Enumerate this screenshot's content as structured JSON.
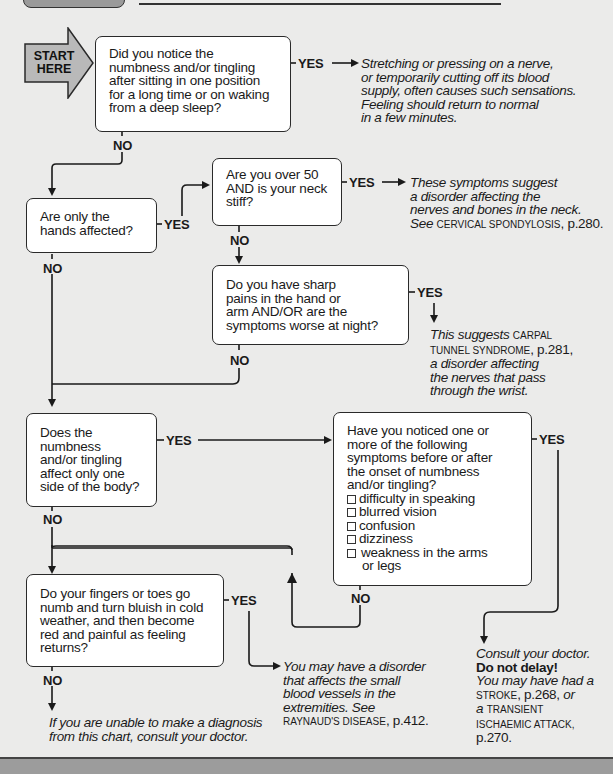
{
  "header": {
    "title_tab": "",
    "rule": true
  },
  "start": {
    "label_line1": "START",
    "label_line2": "HERE"
  },
  "colors": {
    "background": "#ebebea",
    "box_fill": "#ffffff",
    "line": "#1a1a1a",
    "start_arrow": "#b9b9b9",
    "bottom_band": "#9c9c9c"
  },
  "questions": [
    {
      "id": "q1",
      "lines": [
        "Did you notice the",
        "numbness and/or tingling",
        "after sitting in one position",
        "for a long time or on waking",
        "from a deep sleep?"
      ]
    },
    {
      "id": "q2",
      "lines": [
        "Are only the",
        "hands affected?"
      ]
    },
    {
      "id": "q3",
      "lines": [
        "Are you over 50",
        "AND is your neck",
        "stiff?"
      ]
    },
    {
      "id": "q4",
      "lines": [
        "Do you have sharp",
        "pains in the hand or",
        "arm AND/OR are the",
        "symptoms worse at night?"
      ]
    },
    {
      "id": "q5",
      "lines": [
        "Does the",
        "numbness",
        "and/or tingling",
        "affect only one",
        "side of the body?"
      ]
    },
    {
      "id": "q6",
      "lines": [
        "Have you noticed one or",
        "more of the following",
        "symptoms before or after",
        "the onset of numbness",
        "and/or tingling?"
      ],
      "checklist": [
        "difficulty in speaking",
        "blurred vision",
        "confusion",
        "dizziness",
        "weakness in the arms",
        "or legs"
      ]
    },
    {
      "id": "q7",
      "lines": [
        "Do your fingers or toes go",
        "numb and turn bluish in cold",
        "weather, and then become",
        "red and painful as feeling",
        "returns?"
      ]
    }
  ],
  "labels": {
    "yes": "YES",
    "no": "NO"
  },
  "outcomes": {
    "o1": {
      "lines": [
        "Stretching or pressing on a nerve,",
        "or temporarily cutting off its blood",
        "supply, often causes such sensations.",
        "Feeling should return to normal",
        "in a few minutes."
      ]
    },
    "o2": {
      "l1": "These symptoms suggest",
      "l2": "a disorder affecting the",
      "l3": "nerves and bones in the neck.",
      "l4_pre": "See ",
      "l4_ref": "CERVICAL SPONDYLOSIS",
      "l4_page": ", p.280."
    },
    "o3": {
      "l1_pre": "This suggests ",
      "l1_ref": "CARPAL",
      "l2_ref": "TUNNEL SYNDROME",
      "l2_page": ", p.281,",
      "l3": "a disorder affecting",
      "l4": "the nerves that pass",
      "l5": "through the wrist."
    },
    "o4": {
      "l1": "Consult your doctor.",
      "l2": "Do not delay!",
      "l3": "You may have had a",
      "l4_ref": "STROKE",
      "l4_page": ", p.268, ",
      "l4_post": "or",
      "l5_pre": "a ",
      "l5_ref": "TRANSIENT",
      "l6_ref": "ISCHAEMIC ATTACK,",
      "l7_page": "p.270."
    },
    "o5": {
      "l1": "You may have a disorder",
      "l2": "that affects the small",
      "l3": "blood vessels in the",
      "l4": "extremities. See",
      "l5_ref": "RAYNAUD'S DISEASE",
      "l5_page": ", p.412."
    },
    "o6": {
      "lines": [
        "If you are unable to make a diagnosis",
        "from this chart, consult your doctor."
      ]
    }
  }
}
